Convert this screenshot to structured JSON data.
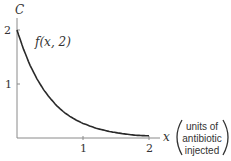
{
  "chart_data": {
    "type": "line",
    "title": "",
    "xlabel": "x",
    "xlabel_note": [
      "units of",
      "antibiotic",
      "injected"
    ],
    "ylabel": "C",
    "x_ticks": [
      "1",
      "2"
    ],
    "y_ticks": [
      "1",
      "2"
    ],
    "xlim": [
      0,
      2
    ],
    "ylim": [
      0,
      2
    ],
    "grid": false,
    "series": [
      {
        "name": "f(x, 2)",
        "x": [
          0,
          0.1,
          0.2,
          0.3,
          0.4,
          0.5,
          0.6,
          0.7,
          0.8,
          0.9,
          1.0,
          1.2,
          1.4,
          1.6,
          1.8,
          2.0
        ],
        "values": [
          2.0,
          1.64,
          1.34,
          1.1,
          0.9,
          0.74,
          0.6,
          0.49,
          0.4,
          0.33,
          0.27,
          0.18,
          0.12,
          0.08,
          0.05,
          0.04
        ]
      }
    ],
    "annotations": [
      "f(x, 2)"
    ]
  },
  "labels": {
    "y_axis": "C",
    "x_axis": "x",
    "curve": "f(x, 2)",
    "note_line1": "units of",
    "note_line2": "antibiotic",
    "note_line3": "injected",
    "ytick_2": "2",
    "ytick_1": "1",
    "xtick_1": "1",
    "xtick_2": "2"
  },
  "colors": {
    "curve": "#2a2a2a",
    "axis": "#7a7a7a",
    "text": "#333333"
  }
}
